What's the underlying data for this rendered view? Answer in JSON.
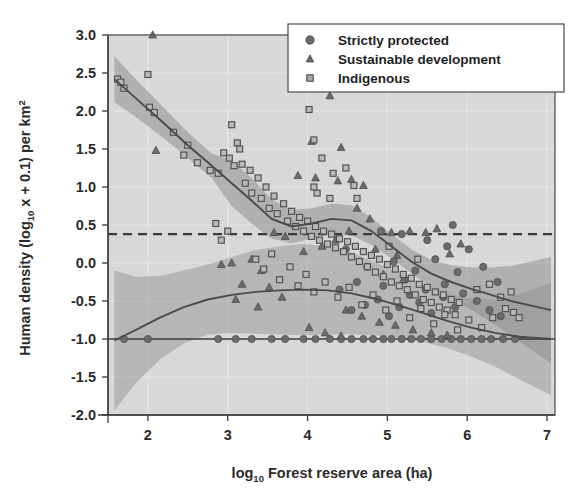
{
  "figure": {
    "background": "#ffffff",
    "plot_background": "#d8d8d8",
    "band_color": "#8f8f8f",
    "curve_color": "#4a4a4a",
    "marker_color": "#6b6b6b",
    "frame_color": "#555555"
  },
  "axes": {
    "x_title_main": "Forest reserve area (ha)",
    "x_title_prefix": "log",
    "x_title_sub": "10",
    "y_title_prefix": "Human density (log",
    "y_title_sub": "10",
    "y_title_mid": " x + 0.1) per km",
    "y_title_sup": "2",
    "x_ticks": [
      "2",
      "3",
      "4",
      "5",
      "6",
      "7"
    ],
    "y_ticks": [
      "3.0",
      "2.5",
      "2.0",
      "1.5",
      "1.0",
      "0.5",
      "0.0",
      "-0.5",
      "-1.0",
      "-1.5",
      "-2.0"
    ]
  },
  "legend": {
    "items": [
      {
        "label": "Strictly protected",
        "marker": "circle-marker"
      },
      {
        "label": "Sustainable development",
        "marker": "triangle-marker"
      },
      {
        "label": "Indigenous",
        "marker": "square-marker"
      }
    ]
  },
  "chart_data": {
    "type": "scatter",
    "title": "",
    "xlabel": "log10 Forest reserve area (ha)",
    "ylabel": "Human density (log10 x + 0.1) per km2",
    "xlim": [
      1.5,
      7.1
    ],
    "ylim": [
      -2.0,
      3.0
    ],
    "xticks": [
      2,
      3,
      4,
      5,
      6,
      7
    ],
    "yticks": [
      -2.0,
      -1.5,
      -1.0,
      -0.5,
      0.0,
      0.5,
      1.0,
      1.5,
      2.0,
      2.5,
      3.0
    ],
    "grid": true,
    "legend_position": "top-right",
    "reference_lines": [
      {
        "name": "dashed-reference-line",
        "y": 0.38,
        "style": "dashed"
      },
      {
        "name": "zero-density-line",
        "y": -1.0,
        "style": "solid"
      }
    ],
    "series": [
      {
        "name": "Strictly protected",
        "marker": "circle",
        "points": [
          [
            1.7,
            -1.0
          ],
          [
            2.0,
            -1.0
          ],
          [
            2.88,
            -1.0
          ],
          [
            3.1,
            -1.0
          ],
          [
            3.3,
            -1.0
          ],
          [
            3.55,
            -1.0
          ],
          [
            3.72,
            -1.0
          ],
          [
            3.95,
            -1.0
          ],
          [
            4.1,
            -1.0
          ],
          [
            4.28,
            -1.0
          ],
          [
            4.42,
            -1.0
          ],
          [
            4.55,
            -1.0
          ],
          [
            4.7,
            -1.0
          ],
          [
            4.82,
            -1.0
          ],
          [
            4.95,
            -1.0
          ],
          [
            5.05,
            -1.0
          ],
          [
            5.18,
            -1.0
          ],
          [
            5.3,
            -1.0
          ],
          [
            5.42,
            -1.0
          ],
          [
            5.55,
            -1.0
          ],
          [
            5.68,
            -1.0
          ],
          [
            5.8,
            -1.0
          ],
          [
            5.92,
            -1.0
          ],
          [
            6.05,
            -1.0
          ],
          [
            6.18,
            -1.0
          ],
          [
            6.3,
            -1.0
          ],
          [
            6.45,
            -1.0
          ],
          [
            6.6,
            -1.0
          ],
          [
            4.55,
            -0.62
          ],
          [
            4.72,
            -0.55
          ],
          [
            4.88,
            -0.48
          ],
          [
            5.02,
            -0.7
          ],
          [
            5.15,
            -0.58
          ],
          [
            5.28,
            -0.42
          ],
          [
            5.4,
            -0.52
          ],
          [
            5.55,
            -0.66
          ],
          [
            5.7,
            -0.45
          ],
          [
            5.85,
            -0.58
          ],
          [
            4.4,
            -0.35
          ],
          [
            4.62,
            -0.25
          ],
          [
            4.95,
            -0.3
          ],
          [
            5.22,
            -0.22
          ],
          [
            5.48,
            -0.35
          ],
          [
            5.72,
            -0.28
          ],
          [
            5.95,
            -0.4
          ],
          [
            6.12,
            -0.5
          ],
          [
            6.28,
            -0.62
          ],
          [
            6.42,
            -0.7
          ],
          [
            4.75,
            -0.05
          ],
          [
            5.08,
            0.02
          ],
          [
            5.35,
            -0.1
          ],
          [
            5.6,
            0.05
          ],
          [
            5.88,
            -0.12
          ],
          [
            4.48,
            0.18
          ],
          [
            5.5,
            0.3
          ],
          [
            5.75,
            0.22
          ],
          [
            4.92,
            0.42
          ],
          [
            5.18,
            0.38
          ],
          [
            5.82,
            0.5
          ],
          [
            6.02,
            0.18
          ],
          [
            6.2,
            -0.05
          ],
          [
            6.38,
            -0.25
          ]
        ]
      },
      {
        "name": "Sustainable development",
        "marker": "triangle",
        "points": [
          [
            2.06,
            3.0
          ],
          [
            2.1,
            1.48
          ],
          [
            4.28,
            2.2
          ],
          [
            4.42,
            1.52
          ],
          [
            4.05,
            1.6
          ],
          [
            3.88,
            1.15
          ],
          [
            4.1,
            1.12
          ],
          [
            4.38,
            1.08
          ],
          [
            4.55,
            1.1
          ],
          [
            4.62,
            0.72
          ],
          [
            4.7,
            1.02
          ],
          [
            3.58,
            0.4
          ],
          [
            3.72,
            0.35
          ],
          [
            3.3,
            0.05
          ],
          [
            3.05,
            0.0
          ],
          [
            2.92,
            -0.02
          ],
          [
            3.42,
            -0.1
          ],
          [
            3.18,
            -0.28
          ],
          [
            3.52,
            -0.32
          ],
          [
            3.68,
            -0.45
          ],
          [
            3.1,
            -0.48
          ],
          [
            3.38,
            -0.58
          ],
          [
            3.95,
            0.15
          ],
          [
            4.18,
            0.22
          ],
          [
            4.35,
            0.3
          ],
          [
            4.52,
            0.42
          ],
          [
            4.78,
            0.58
          ],
          [
            5.05,
            0.4
          ],
          [
            5.28,
            0.42
          ],
          [
            5.48,
            0.4
          ],
          [
            5.62,
            0.45
          ],
          [
            5.78,
            0.12
          ],
          [
            5.92,
            0.25
          ],
          [
            4.85,
            0.18
          ],
          [
            5.12,
            0.1
          ],
          [
            4.95,
            -0.15
          ],
          [
            5.2,
            -0.22
          ],
          [
            4.48,
            -0.62
          ],
          [
            4.68,
            -0.7
          ],
          [
            4.9,
            -0.78
          ],
          [
            5.1,
            -0.82
          ],
          [
            5.32,
            -0.88
          ],
          [
            5.55,
            -0.92
          ],
          [
            5.75,
            -0.95
          ],
          [
            4.02,
            -0.85
          ],
          [
            4.22,
            -0.92
          ],
          [
            4.42,
            -0.96
          ]
        ]
      },
      {
        "name": "Indigenous",
        "marker": "square",
        "points": [
          [
            1.62,
            2.42
          ],
          [
            1.66,
            2.38
          ],
          [
            1.7,
            2.3
          ],
          [
            2.0,
            2.48
          ],
          [
            2.02,
            2.05
          ],
          [
            2.08,
            1.98
          ],
          [
            2.32,
            1.72
          ],
          [
            2.5,
            1.55
          ],
          [
            2.62,
            1.32
          ],
          [
            2.78,
            1.22
          ],
          [
            2.88,
            1.18
          ],
          [
            2.95,
            1.45
          ],
          [
            3.02,
            1.38
          ],
          [
            3.08,
            1.28
          ],
          [
            3.12,
            1.58
          ],
          [
            3.18,
            1.3
          ],
          [
            3.22,
            1.05
          ],
          [
            3.28,
            1.22
          ],
          [
            3.3,
            0.92
          ],
          [
            3.38,
            1.12
          ],
          [
            3.42,
            0.85
          ],
          [
            3.48,
            1.0
          ],
          [
            3.52,
            0.72
          ],
          [
            3.58,
            0.88
          ],
          [
            3.62,
            0.65
          ],
          [
            3.7,
            0.78
          ],
          [
            3.75,
            0.55
          ],
          [
            3.8,
            0.68
          ],
          [
            3.85,
            0.48
          ],
          [
            3.9,
            0.6
          ],
          [
            3.95,
            0.42
          ],
          [
            4.0,
            0.55
          ],
          [
            4.05,
            0.35
          ],
          [
            4.1,
            0.48
          ],
          [
            4.15,
            0.3
          ],
          [
            4.2,
            0.42
          ],
          [
            4.25,
            0.25
          ],
          [
            4.3,
            0.38
          ],
          [
            4.35,
            0.2
          ],
          [
            4.4,
            0.32
          ],
          [
            4.45,
            0.15
          ],
          [
            4.5,
            0.28
          ],
          [
            4.55,
            0.08
          ],
          [
            4.6,
            0.22
          ],
          [
            4.65,
            0.02
          ],
          [
            4.7,
            0.15
          ],
          [
            4.75,
            -0.05
          ],
          [
            4.8,
            0.1
          ],
          [
            4.85,
            -0.12
          ],
          [
            4.9,
            0.05
          ],
          [
            4.95,
            -0.18
          ],
          [
            5.0,
            -0.02
          ],
          [
            5.05,
            -0.25
          ],
          [
            5.1,
            -0.08
          ],
          [
            5.15,
            -0.3
          ],
          [
            5.2,
            -0.15
          ],
          [
            5.25,
            -0.35
          ],
          [
            5.3,
            -0.2
          ],
          [
            5.35,
            -0.42
          ],
          [
            5.4,
            -0.28
          ],
          [
            5.45,
            -0.48
          ],
          [
            5.5,
            -0.32
          ],
          [
            5.55,
            -0.52
          ],
          [
            5.6,
            -0.38
          ],
          [
            5.65,
            -0.58
          ],
          [
            5.7,
            -0.42
          ],
          [
            5.75,
            -0.62
          ],
          [
            5.8,
            -0.48
          ],
          [
            5.85,
            -0.68
          ],
          [
            5.9,
            -0.52
          ],
          [
            3.05,
            1.82
          ],
          [
            3.15,
            1.5
          ],
          [
            4.02,
            2.02
          ],
          [
            4.18,
            1.38
          ],
          [
            4.32,
            1.18
          ],
          [
            4.48,
            1.25
          ],
          [
            4.58,
            1.02
          ],
          [
            4.12,
            0.92
          ],
          [
            4.28,
            0.85
          ],
          [
            4.08,
            1.0
          ],
          [
            2.85,
            0.52
          ],
          [
            2.92,
            0.3
          ],
          [
            3.0,
            0.42
          ],
          [
            3.35,
            0.05
          ],
          [
            3.45,
            -0.08
          ],
          [
            3.55,
            0.12
          ],
          [
            3.65,
            -0.22
          ],
          [
            3.78,
            -0.05
          ],
          [
            3.88,
            -0.3
          ],
          [
            3.98,
            -0.15
          ],
          [
            4.08,
            -0.38
          ],
          [
            4.22,
            -0.25
          ],
          [
            4.38,
            -0.45
          ],
          [
            4.52,
            -0.32
          ],
          [
            4.68,
            -0.55
          ],
          [
            4.82,
            -0.42
          ],
          [
            4.98,
            -0.62
          ],
          [
            5.12,
            -0.5
          ],
          [
            5.28,
            -0.72
          ],
          [
            5.42,
            -0.6
          ],
          [
            5.58,
            -0.8
          ],
          [
            5.72,
            -0.68
          ],
          [
            5.88,
            -0.88
          ],
          [
            6.02,
            -0.75
          ],
          [
            6.18,
            -0.85
          ],
          [
            6.32,
            -0.72
          ],
          [
            6.48,
            -0.6
          ],
          [
            6.58,
            -0.65
          ],
          [
            6.65,
            -0.72
          ],
          [
            6.12,
            -0.35
          ],
          [
            6.28,
            -0.28
          ],
          [
            6.42,
            -0.45
          ],
          [
            6.55,
            -0.38
          ],
          [
            4.08,
            1.62
          ],
          [
            4.62,
            0.85
          ],
          [
            5.02,
            0.22
          ],
          [
            5.38,
            0.05
          ],
          [
            2.45,
            1.42
          ]
        ]
      }
    ],
    "fitted_curves": [
      {
        "name": "upper-trend-curve",
        "x": [
          1.58,
          1.9,
          2.2,
          2.5,
          2.8,
          3.05,
          3.3,
          3.55,
          3.8,
          4.05,
          4.3,
          4.55,
          4.8,
          5.05,
          5.3,
          5.55,
          5.8,
          6.05,
          6.3,
          6.55,
          6.8,
          7.05
        ],
        "y": [
          2.42,
          2.12,
          1.84,
          1.55,
          1.28,
          1.05,
          0.82,
          0.58,
          0.48,
          0.52,
          0.58,
          0.56,
          0.42,
          0.22,
          0.02,
          -0.14,
          -0.25,
          -0.34,
          -0.42,
          -0.5,
          -0.56,
          -0.62
        ]
      },
      {
        "name": "lower-trend-curve",
        "x": [
          1.58,
          1.85,
          2.15,
          2.45,
          2.75,
          3.05,
          3.35,
          3.65,
          3.95,
          4.25,
          4.55,
          4.85,
          5.15,
          5.45,
          5.75,
          6.05,
          6.35,
          6.65,
          7.05
        ],
        "y": [
          -1.02,
          -0.88,
          -0.72,
          -0.58,
          -0.48,
          -0.42,
          -0.38,
          -0.36,
          -0.35,
          -0.36,
          -0.4,
          -0.47,
          -0.56,
          -0.66,
          -0.76,
          -0.85,
          -0.92,
          -0.97,
          -1.0
        ]
      }
    ]
  }
}
